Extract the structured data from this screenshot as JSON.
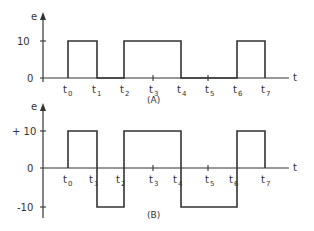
{
  "diagram": {
    "panel_a": {
      "caption": "(A)",
      "y_axis_label": "e",
      "x_axis_label": "t",
      "y_ticks": [
        "10",
        "0"
      ],
      "time_labels": [
        "t",
        "t",
        "t",
        "t",
        "t",
        "t",
        "t",
        "t"
      ],
      "time_subscripts": [
        "0",
        "1",
        "2",
        "3",
        "4",
        "5",
        "6",
        "7"
      ],
      "levels": {
        "high": 10,
        "low": 0
      },
      "segments": [
        {
          "from": "t0",
          "to": "t1",
          "value": 10
        },
        {
          "from": "t1",
          "to": "t2",
          "value": 0
        },
        {
          "from": "t2",
          "to": "t4",
          "value": 10
        },
        {
          "from": "t4",
          "to": "t6",
          "value": 0
        },
        {
          "from": "t6",
          "to": "t7",
          "value": 10
        }
      ]
    },
    "panel_b": {
      "caption": "(B)",
      "y_axis_label": "e",
      "x_axis_label": "t",
      "y_ticks": [
        "+ 10",
        "0",
        "-10"
      ],
      "time_labels": [
        "t",
        "t",
        "t",
        "t",
        "t",
        "t",
        "t",
        "t"
      ],
      "time_subscripts": [
        "0",
        "1",
        "2",
        "3",
        "4",
        "5",
        "6",
        "7"
      ],
      "levels": {
        "high": 10,
        "zero": 0,
        "low": -10
      },
      "segments": [
        {
          "from": "t0",
          "to": "t1",
          "value": 10
        },
        {
          "from": "t1",
          "to": "t2",
          "value": -10
        },
        {
          "from": "t2",
          "to": "t4",
          "value": 10
        },
        {
          "from": "t4",
          "to": "t6",
          "value": -10
        },
        {
          "from": "t6",
          "to": "t7",
          "value": 10
        }
      ]
    },
    "colors": {
      "line": "#333333",
      "background": "#ffffff"
    }
  }
}
